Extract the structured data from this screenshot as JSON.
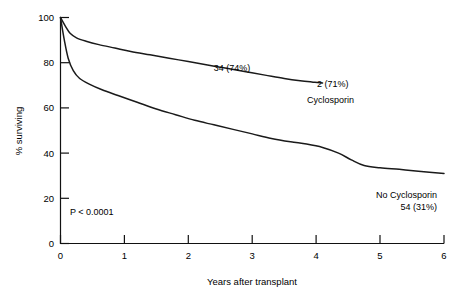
{
  "chart_data": {
    "type": "line",
    "title": "",
    "subtitle": "",
    "xlabel": "Years after transplant",
    "ylabel": "% surviving",
    "xlim": [
      0,
      6
    ],
    "ylim": [
      0,
      100
    ],
    "xticks": [
      0,
      1,
      2,
      3,
      4,
      5,
      6
    ],
    "xtick_labels": [
      "0",
      "1",
      "2",
      "3",
      "4",
      "5",
      "6"
    ],
    "yticks": [
      0,
      20,
      40,
      60,
      80,
      100
    ],
    "ytick_labels": [
      "0",
      "20",
      "40",
      "60",
      "80",
      "100"
    ],
    "grid": false,
    "legend_position": "inline-annotations",
    "series": [
      {
        "name": "Cyclosporin",
        "at_risk_label": "2 (71%)",
        "mid_label": "34 (74%)",
        "x": [
          0.0,
          0.08,
          0.15,
          0.25,
          0.4,
          0.6,
          0.85,
          1.1,
          1.4,
          1.7,
          2.0,
          2.3,
          2.6,
          2.9,
          3.2,
          3.5,
          3.75,
          3.95,
          4.1
        ],
        "y": [
          100.0,
          96.0,
          93.0,
          91.0,
          89.5,
          88.0,
          86.5,
          85.0,
          83.5,
          82.0,
          80.5,
          79.0,
          77.5,
          76.0,
          74.5,
          73.0,
          72.0,
          71.4,
          71.0
        ]
      },
      {
        "name": "No Cyclosporin",
        "at_risk_label": "54 (31%)",
        "x": [
          0.0,
          0.06,
          0.12,
          0.2,
          0.3,
          0.45,
          0.65,
          0.9,
          1.2,
          1.5,
          1.8,
          2.1,
          2.4,
          2.7,
          3.0,
          3.3,
          3.6,
          3.85,
          4.1,
          4.35,
          4.55,
          4.75,
          5.0,
          5.3,
          5.6,
          6.0
        ],
        "y": [
          100.0,
          90.0,
          82.0,
          76.5,
          73.0,
          70.5,
          68.0,
          65.5,
          62.5,
          59.5,
          57.0,
          54.5,
          52.5,
          50.5,
          48.5,
          46.5,
          45.0,
          44.0,
          42.5,
          40.0,
          37.0,
          34.5,
          33.5,
          32.8,
          32.0,
          31.0
        ]
      }
    ],
    "annotations": [
      {
        "text": "34 (74%)",
        "x": 2.55,
        "y": 81.5,
        "series": "Cyclosporin"
      },
      {
        "text": "2 (71%)",
        "x": 4.25,
        "y": 73.5,
        "series": "Cyclosporin"
      },
      {
        "text": "Cyclosporin",
        "x": 4.25,
        "y": 66.0,
        "series": "Cyclosporin"
      },
      {
        "text": "No Cyclosporin",
        "x": 5.05,
        "y": 26.0,
        "series": "No Cyclosporin"
      },
      {
        "text": "54 (31%)",
        "x": 5.05,
        "y": 20.5,
        "series": "No Cyclosporin"
      },
      {
        "text": "P < 0.0001",
        "x": 0.55,
        "y": 14.0,
        "series": "statistic"
      }
    ],
    "statistic": "P < 0.0001"
  },
  "labels": {
    "y_axis_title": "% surviving",
    "x_axis_title": "Years after transplant",
    "y_tick_100": "100",
    "y_tick_80": "80",
    "y_tick_60": "60",
    "y_tick_40": "40",
    "y_tick_20": "20",
    "y_tick_0": "0",
    "x_tick_0": "0",
    "x_tick_1": "1",
    "x_tick_2": "2",
    "x_tick_3": "3",
    "x_tick_4": "4",
    "x_tick_5": "5",
    "x_tick_6": "6",
    "annot_34": "34 (74%)",
    "annot_2": "2 (71%)",
    "annot_cyclosporin": "Cyclosporin",
    "annot_no_cyclosporin": "No Cyclosporin",
    "annot_54": "54 (31%)",
    "annot_pvalue": "P < 0.0001"
  },
  "colors": {
    "background": "#ffffff",
    "axis": "#111111",
    "curve": "#1a1a1a",
    "text": "#000000"
  }
}
